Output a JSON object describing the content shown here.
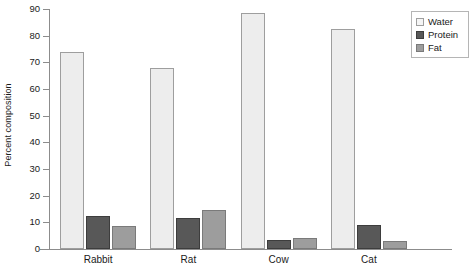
{
  "chart_data": {
    "type": "bar",
    "title": "",
    "xlabel": "",
    "ylabel": "Percent composition",
    "ylim": [
      0,
      90
    ],
    "yticks": [
      0,
      10,
      20,
      30,
      40,
      50,
      60,
      70,
      80,
      90
    ],
    "ytick_labels": [
      "0",
      "10",
      "20",
      "30",
      "40",
      "50",
      "60",
      "70",
      "80",
      "90"
    ],
    "grid": false,
    "legend_position": "top-right",
    "categories": [
      "Rabbit",
      "Rat",
      "Cow",
      "Cat"
    ],
    "series": [
      {
        "name": "Water",
        "color": "#ededed",
        "values": [
          74,
          68,
          88.5,
          82.5
        ]
      },
      {
        "name": "Protein",
        "color": "#585858",
        "values": [
          12.5,
          11.5,
          3.2,
          9
        ]
      },
      {
        "name": "Fat",
        "color": "#9d9d9d",
        "values": [
          8.5,
          14.5,
          4.3,
          3
        ]
      }
    ]
  },
  "legend": {
    "items": [
      {
        "label": "Water"
      },
      {
        "label": "Protein"
      },
      {
        "label": "Fat"
      }
    ]
  }
}
